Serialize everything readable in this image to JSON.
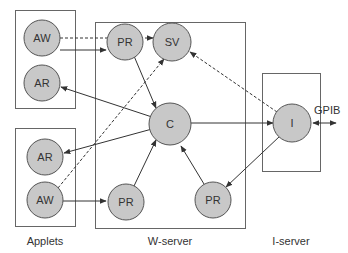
{
  "colors": {
    "node_fill": "#c8c8c8",
    "node_stroke": "#555555",
    "box_stroke": "#666666",
    "line": "#333333"
  },
  "groups": [
    {
      "id": "applets",
      "caption": "Applets"
    },
    {
      "id": "w-server",
      "caption": "W-server"
    },
    {
      "id": "i-server",
      "caption": "I-server"
    }
  ],
  "nodes": {
    "aw1": "AW",
    "ar1": "AR",
    "ar2": "AR",
    "aw2": "AW",
    "pr_top": "PR",
    "sv": "SV",
    "c": "C",
    "pr_bl": "PR",
    "pr_br": "PR",
    "i": "I"
  },
  "external": {
    "gpib": "GPIB"
  },
  "edges": [
    {
      "from": "aw1",
      "to": "pr_top",
      "style": "solid"
    },
    {
      "from": "aw1",
      "to": "sv",
      "style": "dashed"
    },
    {
      "from": "pr_top",
      "to": "c",
      "style": "solid"
    },
    {
      "from": "c",
      "to": "ar1",
      "style": "solid"
    },
    {
      "from": "c",
      "to": "ar2",
      "style": "solid"
    },
    {
      "from": "c",
      "to": "i",
      "style": "solid"
    },
    {
      "from": "i",
      "to": "sv",
      "style": "dashed"
    },
    {
      "from": "i",
      "to": "pr_br",
      "style": "solid"
    },
    {
      "from": "pr_br",
      "to": "c",
      "style": "solid"
    },
    {
      "from": "pr_bl",
      "to": "c",
      "style": "solid"
    },
    {
      "from": "aw2",
      "to": "pr_bl",
      "style": "solid"
    },
    {
      "from": "aw2",
      "to": "sv",
      "style": "dashed"
    },
    {
      "from": "i",
      "to": "gpib",
      "style": "solid-bidirectional"
    }
  ]
}
